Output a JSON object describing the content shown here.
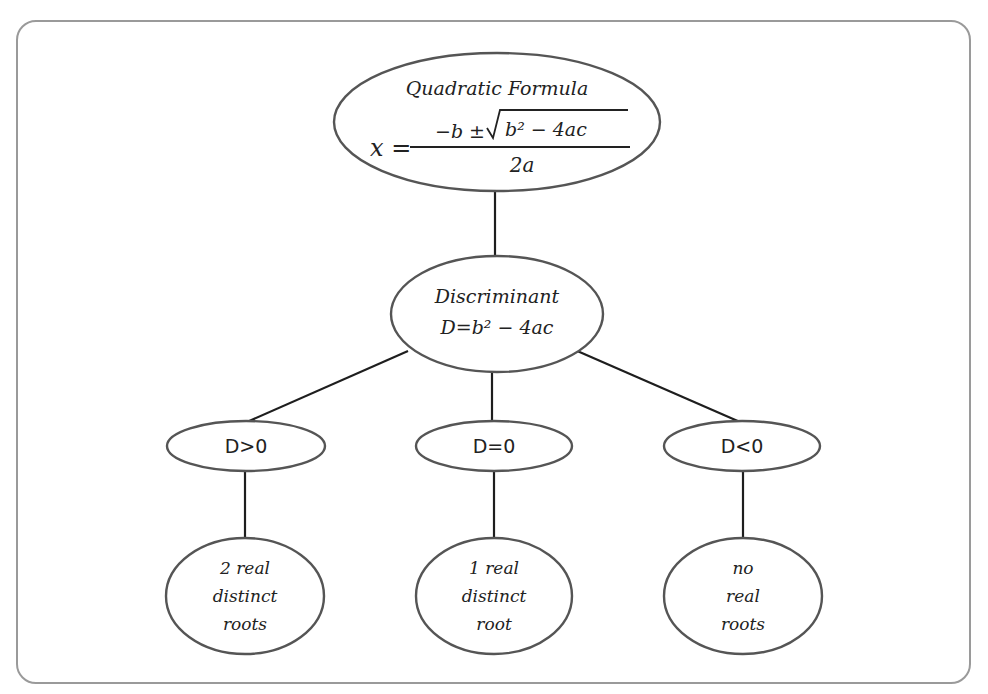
{
  "diagram": {
    "type": "tree",
    "root": {
      "title": "Quadratic Formula",
      "formula": {
        "lhs": "x =",
        "numerator": "−b ± √(b² − 4ac)",
        "numerator_prefix": "−b ±",
        "radicand": "b² − 4ac",
        "denominator": "2a"
      }
    },
    "discriminant": {
      "title": "Discriminant",
      "formula": "D=b² − 4ac"
    },
    "conditions": [
      {
        "label": "D>0",
        "result_lines": [
          "2 real",
          "distinct",
          "roots"
        ]
      },
      {
        "label": "D=0",
        "result_lines": [
          "1 real",
          "distinct",
          "root"
        ]
      },
      {
        "label": "D<0",
        "result_lines": [
          "no",
          "real",
          "roots"
        ]
      }
    ],
    "edges": [
      [
        "Quadratic Formula",
        "Discriminant"
      ],
      [
        "Discriminant",
        "D>0"
      ],
      [
        "Discriminant",
        "D=0"
      ],
      [
        "Discriminant",
        "D<0"
      ],
      [
        "D>0",
        "2 real distinct roots"
      ],
      [
        "D=0",
        "1 real distinct root"
      ],
      [
        "D<0",
        "no real roots"
      ]
    ]
  },
  "colors": {
    "stroke": "#555555",
    "edge": "#1e1e1e",
    "frame": "#9a9a9a",
    "text": "#222222",
    "background": "#ffffff"
  }
}
